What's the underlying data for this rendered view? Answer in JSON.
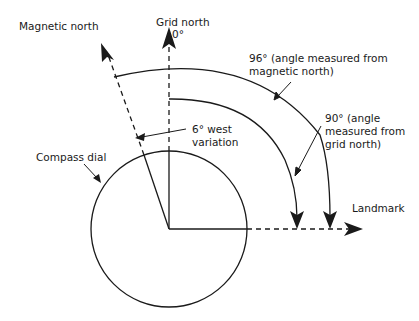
{
  "diagram": {
    "labels": {
      "magnetic_north": "Magnetic north",
      "grid_north": "Grid north",
      "zero_degrees": "0°",
      "angle_96_line1": "96° (angle measured from",
      "angle_96_line2": "magnetic north)",
      "angle_90_line1": "90° (angle",
      "angle_90_line2": "measured from",
      "angle_90_line3": "grid north)",
      "variation_line1": "6° west",
      "variation_line2": "variation",
      "compass_dial": "Compass dial",
      "landmark": "Landmark"
    },
    "values": {
      "bearing_from_magnetic_north_deg": 96,
      "bearing_from_grid_north_deg": 90,
      "variation_deg": 6,
      "variation_direction": "west"
    },
    "colors": {
      "stroke": "#1a1a1a",
      "background": "#ffffff"
    }
  }
}
